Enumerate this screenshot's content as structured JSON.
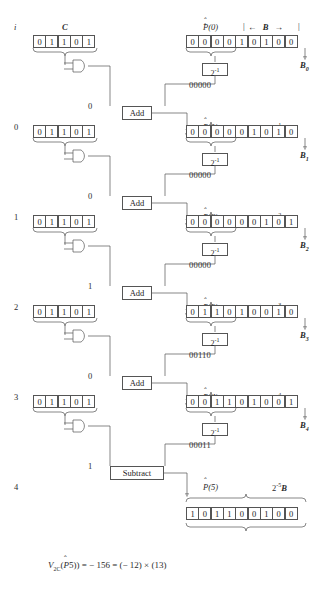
{
  "figure": {
    "row_index_header": "i",
    "c_label": "C",
    "b_label": "B",
    "b_arrow_left": "←",
    "b_arrow_right": "→",
    "shift_box_label": "2",
    "shift_box_exp": "-1",
    "add_label": "Add",
    "subtract_label": "Subtract",
    "multiplicand_bits": [
      "0",
      "1",
      "1",
      "0",
      "1"
    ],
    "rows": [
      {
        "index": "i",
        "p_label": "P(0)",
        "bits": [
          "0",
          "0",
          "0",
          "0",
          "1",
          "0",
          "1",
          "0",
          "0"
        ],
        "gate_out": "0",
        "shifted": "00000",
        "op": "Add",
        "b_sub": "B",
        "b_sub_idx": "0",
        "weight_base": "2",
        "weight_exp": "",
        "weight_suffix": ""
      },
      {
        "index": "0",
        "p_label": "P(1)",
        "bits": [
          "0",
          "0",
          "0",
          "0",
          "0",
          "1",
          "0",
          "1",
          "0"
        ],
        "gate_out": "0",
        "shifted": "00000",
        "op": "Add",
        "b_sub": "B",
        "b_sub_idx": "1",
        "weight_base": "2",
        "weight_exp": "-1",
        "weight_suffix": "B"
      },
      {
        "index": "1",
        "p_label": "P(2)",
        "bits": [
          "0",
          "0",
          "0",
          "0",
          "0",
          "0",
          "1",
          "0",
          "1"
        ],
        "gate_out": "1",
        "shifted": "00000",
        "op": "Add",
        "b_sub": "B",
        "b_sub_idx": "2",
        "weight_base": "2",
        "weight_exp": "-2",
        "weight_suffix": "B"
      },
      {
        "index": "2",
        "p_label": "P(3)",
        "bits": [
          "0",
          "1",
          "1",
          "0",
          "1",
          "0",
          "0",
          "1",
          "0"
        ],
        "gate_out": "0",
        "shifted": "00110",
        "op": "Add",
        "b_sub": "B",
        "b_sub_idx": "3",
        "weight_base": "2",
        "weight_exp": "-3",
        "weight_suffix": "B"
      },
      {
        "index": "3",
        "p_label": "P(4)",
        "bits": [
          "0",
          "0",
          "1",
          "1",
          "0",
          "1",
          "0",
          "0",
          "1"
        ],
        "gate_out": "1",
        "shifted": "00011",
        "op": "Subtract",
        "b_sub": "B",
        "b_sub_idx": "4",
        "weight_base": "2",
        "weight_exp": "-4",
        "weight_suffix": "B"
      },
      {
        "index": "4",
        "p_label": "P(5)",
        "bits": [
          "1",
          "0",
          "1",
          "1",
          "0",
          "0",
          "1",
          "0",
          "0"
        ],
        "gate_out": "",
        "shifted": "",
        "op": "",
        "b_sub": "",
        "b_sub_idx": "",
        "weight_base": "2",
        "weight_exp": "-5",
        "weight_suffix": "B"
      }
    ],
    "result": {
      "v_symbol": "V",
      "v_subscript": "2C",
      "expression": "(P5)) = − 156 = (− 12) × (13)",
      "p_hat": "P",
      "full_text": "V2C(P5)) = − 156 = (− 12) × (13)"
    },
    "colors": {
      "ink": "#2b2b2b",
      "line": "#555555",
      "background": "#ffffff"
    }
  }
}
